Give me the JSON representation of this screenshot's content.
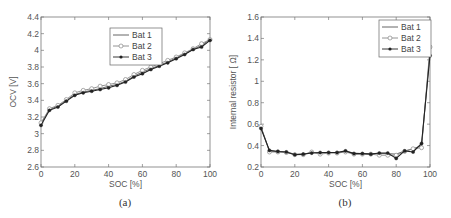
{
  "chart_data": [
    {
      "id": "a",
      "type": "line",
      "title": "",
      "caption": "(a)",
      "xlabel": "SOC [%]",
      "ylabel": "OCV [V]",
      "xlim": [
        0,
        100
      ],
      "ylim": [
        2.6,
        4.4
      ],
      "xticks": [
        0,
        20,
        40,
        60,
        80,
        100
      ],
      "xtick_labels": [
        "0",
        "20",
        "40",
        "60",
        "80",
        "100"
      ],
      "yticks": [
        2.6,
        2.8,
        3.0,
        3.2,
        3.4,
        3.6,
        3.8,
        4.0,
        4.2,
        4.4
      ],
      "ytick_labels": [
        "2.6",
        "2.8",
        "3",
        "3.2",
        "3.4",
        "3.6",
        "3.8",
        "4",
        "4.2",
        "4.4"
      ],
      "grid": false,
      "legend_position": "top-center",
      "x": [
        0,
        5,
        10,
        15,
        20,
        25,
        30,
        35,
        40,
        45,
        50,
        55,
        60,
        65,
        70,
        75,
        80,
        85,
        90,
        95,
        100
      ],
      "series": [
        {
          "name": "Bat 1",
          "marker": "none",
          "color": "#555555",
          "values": [
            3.12,
            3.29,
            3.33,
            3.4,
            3.47,
            3.5,
            3.52,
            3.54,
            3.57,
            3.59,
            3.63,
            3.69,
            3.74,
            3.78,
            3.82,
            3.86,
            3.91,
            3.96,
            4.01,
            4.06,
            4.13
          ]
        },
        {
          "name": "Bat 2",
          "marker": "circle",
          "color": "#888888",
          "values": [
            3.13,
            3.3,
            3.34,
            3.41,
            3.49,
            3.52,
            3.54,
            3.57,
            3.59,
            3.61,
            3.65,
            3.71,
            3.76,
            3.8,
            3.84,
            3.88,
            3.92,
            3.97,
            4.02,
            4.08,
            4.13
          ]
        },
        {
          "name": "Bat 3",
          "marker": "filled-circle",
          "color": "#222222",
          "values": [
            3.1,
            3.28,
            3.32,
            3.39,
            3.46,
            3.49,
            3.51,
            3.53,
            3.55,
            3.58,
            3.62,
            3.68,
            3.72,
            3.77,
            3.81,
            3.85,
            3.9,
            3.95,
            4.01,
            4.04,
            4.12
          ]
        }
      ]
    },
    {
      "id": "b",
      "type": "line",
      "title": "",
      "caption": "(b)",
      "xlabel": "SOC [%]",
      "ylabel": "Internal resistor [ Ω]",
      "xlim": [
        0,
        100
      ],
      "ylim": [
        0.2,
        1.6
      ],
      "xticks": [
        0,
        20,
        40,
        60,
        80,
        100
      ],
      "xtick_labels": [
        "0",
        "20",
        "40",
        "60",
        "80",
        "100"
      ],
      "yticks": [
        0.2,
        0.4,
        0.6,
        0.8,
        1.0,
        1.2,
        1.4,
        1.6
      ],
      "ytick_labels": [
        "0.2",
        "0.4",
        "0.6",
        "0.8",
        "1",
        "1.2",
        "1.4",
        "1.6"
      ],
      "grid": false,
      "legend_position": "top-right",
      "x": [
        0,
        5,
        10,
        15,
        20,
        25,
        30,
        35,
        40,
        45,
        50,
        55,
        60,
        65,
        70,
        75,
        80,
        85,
        90,
        95,
        100
      ],
      "series": [
        {
          "name": "Bat 1",
          "marker": "none",
          "color": "#555555",
          "values": [
            0.57,
            0.35,
            0.345,
            0.34,
            0.32,
            0.32,
            0.335,
            0.33,
            0.335,
            0.335,
            0.345,
            0.33,
            0.325,
            0.325,
            0.325,
            0.325,
            0.32,
            0.35,
            0.37,
            0.4,
            1.28
          ]
        },
        {
          "name": "Bat 2",
          "marker": "circle",
          "color": "#888888",
          "values": [
            0.58,
            0.34,
            0.34,
            0.335,
            0.315,
            0.315,
            0.34,
            0.32,
            0.33,
            0.33,
            0.34,
            0.32,
            0.32,
            0.32,
            0.31,
            0.31,
            0.31,
            0.345,
            0.37,
            0.38,
            1.32
          ]
        },
        {
          "name": "Bat 3",
          "marker": "filled-circle",
          "color": "#222222",
          "values": [
            0.56,
            0.355,
            0.345,
            0.34,
            0.315,
            0.32,
            0.33,
            0.335,
            0.335,
            0.335,
            0.35,
            0.325,
            0.325,
            0.32,
            0.33,
            0.33,
            0.28,
            0.35,
            0.34,
            0.42,
            1.24
          ]
        }
      ]
    }
  ]
}
